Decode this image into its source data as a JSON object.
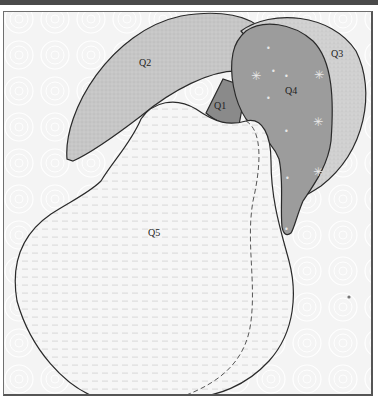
{
  "diagram": {
    "regions": [
      {
        "id": "Q1",
        "label": "Q1",
        "part": "stem",
        "color": "#8a8a8a"
      },
      {
        "id": "Q2",
        "label": "Q2",
        "part": "left leaf",
        "color": "#c4c4c4"
      },
      {
        "id": "Q3",
        "label": "Q3",
        "part": "right leaf (outer)",
        "color": "#cfcfcf"
      },
      {
        "id": "Q4",
        "label": "Q4",
        "part": "right leaf (inner, starred)",
        "color": "#9c9c9c"
      },
      {
        "id": "Q5",
        "label": "Q5",
        "part": "pear body (dotted)",
        "color": "#f3f3f3"
      }
    ],
    "background_color": "#f4f4f4",
    "outline_color": "#2a2a2a"
  }
}
